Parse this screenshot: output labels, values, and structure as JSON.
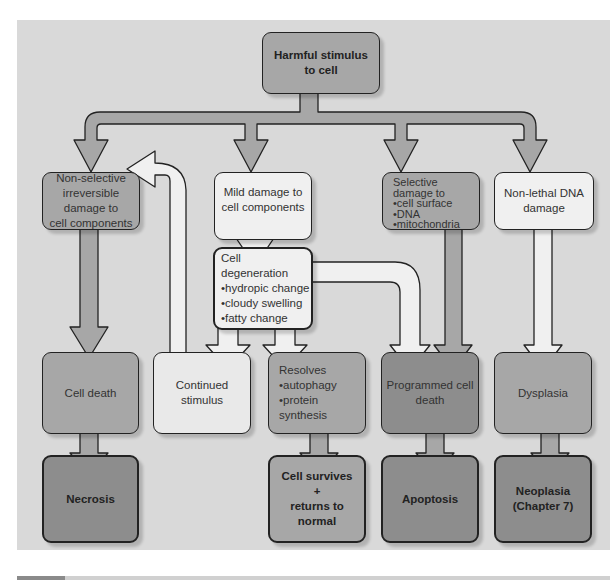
{
  "diagram": {
    "root": {
      "label": "Harmful stimulus\nto cell"
    },
    "level1": [
      {
        "id": "nonselective",
        "label": "Non-selective\nirreversible\ndamage to\ncell components"
      },
      {
        "id": "mild",
        "label": "Mild damage to\ncell components"
      },
      {
        "id": "selective",
        "label": "Selective\ndamage to\n•cell surface\n•DNA\n•mitochondria"
      },
      {
        "id": "nonlethal",
        "label": "Non-lethal DNA\ndamage"
      }
    ],
    "degeneration": {
      "label": "Cell degeneration\n•hydropic change\n•cloudy swelling\n•fatty change"
    },
    "level3": [
      {
        "id": "celldeath",
        "label": "Cell death"
      },
      {
        "id": "continued",
        "label": "Continued\nstimulus"
      },
      {
        "id": "resolves",
        "label": "Resolves\n•autophagy\n•protein\nsynthesis"
      },
      {
        "id": "programmed",
        "label": "Programmed cell\ndeath"
      },
      {
        "id": "dysplasia",
        "label": "Dysplasia"
      }
    ],
    "outcomes": [
      {
        "id": "necrosis",
        "label": "Necrosis"
      },
      {
        "id": "survives",
        "label": "Cell survives\n+\nreturns to\nnormal"
      },
      {
        "id": "apoptosis",
        "label": "Apoptosis"
      },
      {
        "id": "neoplasia",
        "label": "Neoplasia\n(Chapter 7)"
      }
    ],
    "colors": {
      "background": "#d9d9d9",
      "dark_box": "#8d8d8d",
      "mid_box": "#a7a7a7",
      "light_box": "#f0f0f0",
      "border": "#222222"
    }
  }
}
